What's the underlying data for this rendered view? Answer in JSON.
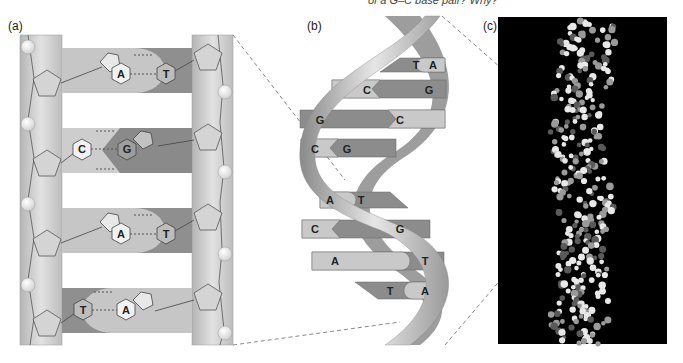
{
  "caption": "of a G–C base pair? Why?",
  "panels": {
    "a": {
      "label": "(a)"
    },
    "b": {
      "label": "(b)"
    },
    "c": {
      "label": "(c)"
    }
  },
  "panel_a_pairs": [
    {
      "left": "A",
      "right": "T"
    },
    {
      "left": "C",
      "right": "G"
    },
    {
      "left": "A",
      "right": "T"
    },
    {
      "left": "T",
      "right": "A"
    }
  ],
  "panel_b_pairs": [
    {
      "left": "T",
      "right": "A"
    },
    {
      "left": "C",
      "right": "G"
    },
    {
      "left": "G",
      "right": "C"
    },
    {
      "left": "C",
      "right": "G"
    },
    {
      "left": "A",
      "right": "T"
    },
    {
      "left": "C",
      "right": "G"
    },
    {
      "left": "A",
      "right": "T"
    },
    {
      "left": "T",
      "right": "A"
    }
  ],
  "colors": {
    "backbone": "#c8c8c8",
    "purine_light": "#c4c4c4",
    "pyrimidine_dark": "#8a8a8a",
    "background_c": "#000000"
  }
}
